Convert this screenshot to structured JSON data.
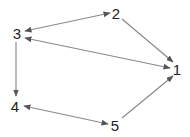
{
  "diagram": {
    "type": "directed-graph",
    "colors": {
      "edge": "#8a8a8a",
      "arrowhead": "#555555",
      "label": "#222222",
      "background": "#ffffff"
    },
    "nodes": [
      {
        "id": "1",
        "label": "1",
        "x": 177,
        "y": 70
      },
      {
        "id": "2",
        "label": "2",
        "x": 116,
        "y": 14
      },
      {
        "id": "3",
        "label": "3",
        "x": 17,
        "y": 34
      },
      {
        "id": "4",
        "label": "4",
        "x": 14,
        "y": 107
      },
      {
        "id": "5",
        "label": "5",
        "x": 115,
        "y": 125
      }
    ],
    "edges": [
      {
        "from": "3",
        "to": "2",
        "bidirectional": true
      },
      {
        "from": "3",
        "to": "1",
        "bidirectional": true
      },
      {
        "from": "2",
        "to": "1",
        "bidirectional": false
      },
      {
        "from": "5",
        "to": "1",
        "bidirectional": false
      },
      {
        "from": "3",
        "to": "4",
        "bidirectional": false
      },
      {
        "from": "4",
        "to": "5",
        "bidirectional": true
      }
    ]
  }
}
